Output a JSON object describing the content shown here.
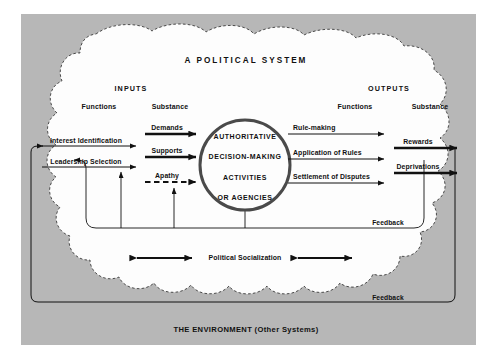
{
  "figure": {
    "title": "A POLITICAL SYSTEM",
    "environment_label": "THE ENVIRONMENT (Other Systems)"
  },
  "inputs": {
    "heading": "INPUTS",
    "col_functions": "Functions",
    "col_substance": "Substance",
    "functions": [
      {
        "label": "Interest  Identification",
        "style": "solid"
      },
      {
        "label": "Leadership  Selection",
        "style": "solid"
      }
    ],
    "substance": [
      {
        "label": "Demands",
        "style": "solid-bold"
      },
      {
        "label": "Supports",
        "style": "solid-bold"
      },
      {
        "label": "Apathy",
        "style": "dashed-bold"
      }
    ]
  },
  "core": {
    "lines": [
      "AUTHORITATIVE",
      "DECISION-MAKING",
      "ACTIVITIES",
      "OR  AGENCIES"
    ]
  },
  "outputs": {
    "heading": "OUTPUTS",
    "col_functions": "Functions",
    "col_substance": "Substance",
    "functions": [
      {
        "label": "Rule-making",
        "style": "solid"
      },
      {
        "label": "Application of Rules",
        "style": "solid"
      },
      {
        "label": "Settlement of Disputes",
        "style": "solid"
      }
    ],
    "substance": [
      {
        "label": "Rewards",
        "style": "solid-bold"
      },
      {
        "label": "Deprivations",
        "style": "solid-bold"
      }
    ]
  },
  "socialization": {
    "label": "Political Socialization"
  },
  "feedback": {
    "inner_label": "Feedback",
    "outer_label": "Feedback"
  },
  "colors": {
    "environment_gray": "#b7b7b7",
    "system_white": "#fdfdfd",
    "ink": "#111111",
    "circle_stroke": "#4a4a4a",
    "page_white": "#ffffff"
  }
}
